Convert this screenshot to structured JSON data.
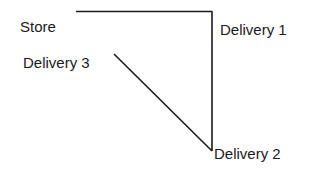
{
  "diagram": {
    "type": "route-map",
    "nodes": [
      {
        "id": "store",
        "label": "Store"
      },
      {
        "id": "delivery1",
        "label": "Delivery 1"
      },
      {
        "id": "delivery2",
        "label": "Delivery 2"
      },
      {
        "id": "delivery3",
        "label": "Delivery 3"
      }
    ],
    "edges": [
      {
        "from": "store",
        "to": "delivery1"
      },
      {
        "from": "delivery1",
        "to": "delivery2"
      },
      {
        "from": "delivery2",
        "to": "delivery3"
      }
    ],
    "line_color": "#1a1a1a"
  }
}
